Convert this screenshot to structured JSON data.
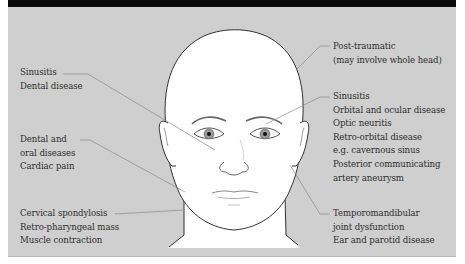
{
  "figure": {
    "background_color": "#cfcfcf",
    "header_bar_color": "#0a0a0a",
    "line_color": "#8a8a8a",
    "face_fill": "#ffffff"
  },
  "labels": {
    "left_upper": {
      "lines": [
        "Sinusitis",
        "Dental disease"
      ]
    },
    "left_middle": {
      "lines": [
        "Dental and",
        "oral diseases",
        "Cardiac pain"
      ]
    },
    "left_lower": {
      "lines": [
        "Cervical spondylosis",
        "Retro-pharyngeal mass",
        "Muscle contraction"
      ]
    },
    "right_top": {
      "lines": [
        "Post-traumatic",
        "(may involve whole head)"
      ]
    },
    "right_middle": {
      "lines": [
        "Sinusitis",
        "Orbital and ocular disease",
        "Optic neuritis",
        "Retro-orbital disease",
        "e.g. cavernous sinus",
        "Posterior communicating",
        "artery aneurysm"
      ]
    },
    "right_lower": {
      "lines": [
        "Temporomandibular",
        "joint dysfunction",
        "Ear and parotid disease"
      ]
    }
  }
}
